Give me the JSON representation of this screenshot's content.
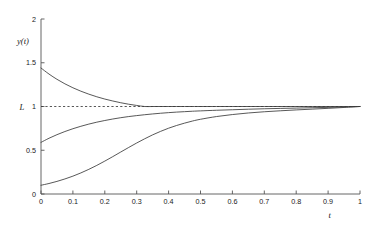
{
  "chart_data": {
    "type": "line",
    "title": "",
    "subtitle": "",
    "xlabel": "t",
    "ylabel": "y(t)",
    "xlim": [
      0,
      1
    ],
    "ylim": [
      0,
      2
    ],
    "grid": false,
    "legend": "none",
    "x_ticks": [
      "0",
      "0.1",
      "0.2",
      "0.3",
      "0.4",
      "0.5",
      "0.6",
      "0.7",
      "0.8",
      "0.9",
      "1"
    ],
    "x_tick_values": [
      0,
      0.1,
      0.2,
      0.3,
      0.4,
      0.5,
      0.6,
      0.7,
      0.8,
      0.9,
      1
    ],
    "y_ticks": [
      "0",
      "0.5",
      "1",
      "1.5",
      "2"
    ],
    "y_tick_values": [
      0,
      0.5,
      1,
      1.5,
      2
    ],
    "annotations": [
      {
        "name": "limit-label",
        "text": "L",
        "x": 0,
        "y": 1,
        "note": "limit value marker on y-axis at y = 1"
      }
    ],
    "reference_lines": [
      {
        "name": "limit-asymptote",
        "orientation": "horizontal",
        "value": 1,
        "style": "dashed",
        "label": "L"
      }
    ],
    "x": [
      0,
      0.025,
      0.05,
      0.075,
      0.1,
      0.125,
      0.15,
      0.175,
      0.2,
      0.225,
      0.25,
      0.275,
      0.3,
      0.325,
      0.35,
      0.375,
      0.4,
      0.425,
      0.45,
      0.475,
      0.5,
      0.55,
      0.6,
      0.65,
      0.7,
      0.75,
      0.8,
      0.85,
      0.9,
      0.95,
      1
    ],
    "series": [
      {
        "name": "decaying-curve",
        "description": "decays from above toward L = 1",
        "start_value": 1.44,
        "end_value": 1.0,
        "values": [
          1.44,
          1.371,
          1.311,
          1.259,
          1.214,
          1.175,
          1.141,
          1.111,
          1.085,
          1.063,
          1.043,
          1.026,
          1.012,
          1.0,
          1.0,
          1.0,
          1.0,
          1.0,
          1.0,
          1.0,
          1.0,
          1.0,
          1.0,
          1.0,
          1.0,
          1.0,
          1.0,
          1.0,
          1.0,
          1.0,
          1.0
        ]
      },
      {
        "name": "concave-rising-curve",
        "description": "rises concavely from 0.59 toward L = 1",
        "start_value": 0.59,
        "end_value": 1.0,
        "values": [
          0.59,
          0.637,
          0.678,
          0.714,
          0.746,
          0.774,
          0.799,
          0.821,
          0.84,
          0.857,
          0.872,
          0.885,
          0.896,
          0.906,
          0.915,
          0.923,
          0.93,
          0.936,
          0.941,
          0.946,
          0.95,
          0.957,
          0.963,
          0.969,
          0.974,
          0.978,
          0.982,
          0.986,
          0.99,
          0.995,
          1.0
        ]
      },
      {
        "name": "logistic-rising-curve",
        "description": "sigmoid rise from 0.10 toward L = 1",
        "start_value": 0.1,
        "end_value": 1.0,
        "values": [
          0.1,
          0.12,
          0.144,
          0.172,
          0.204,
          0.241,
          0.282,
          0.327,
          0.376,
          0.427,
          0.48,
          0.532,
          0.583,
          0.631,
          0.676,
          0.716,
          0.752,
          0.783,
          0.81,
          0.834,
          0.854,
          0.885,
          0.908,
          0.926,
          0.94,
          0.951,
          0.961,
          0.97,
          0.979,
          0.989,
          1.0
        ]
      }
    ]
  }
}
